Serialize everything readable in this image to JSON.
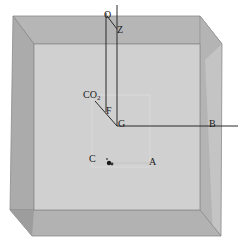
{
  "diagram": {
    "type": "3d-box-with-axes",
    "colors": {
      "background": "#ffffff",
      "front_face": "#cfcfcf",
      "top_face": "#b4b4b4",
      "left_face": "#a9a9a9",
      "right_face": "#bdbdbd",
      "bottom_face": "#b0b0b0",
      "edge": "#8a8a8a",
      "axis_line": "#2a2a2a",
      "label": "#1a1a1a"
    },
    "labels": {
      "O": "O",
      "Z": "Z",
      "CO2_main": "CO",
      "CO2_sub": "2",
      "F": "F",
      "G": "G",
      "B": "B",
      "C": "C",
      "A": "A"
    }
  }
}
